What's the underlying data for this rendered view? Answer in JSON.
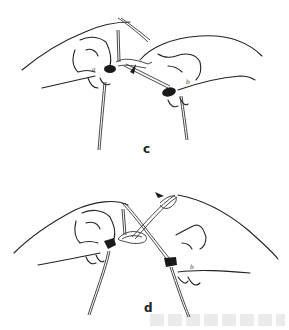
{
  "figure": {
    "panels": [
      {
        "id": "c",
        "label": "c",
        "finger_labels": {
          "left": "a",
          "right": "b"
        }
      },
      {
        "id": "d",
        "label": "d",
        "finger_labels": {
          "right": "b"
        }
      }
    ]
  },
  "colors": {
    "background": "#ffffff",
    "ink": "#222222"
  }
}
